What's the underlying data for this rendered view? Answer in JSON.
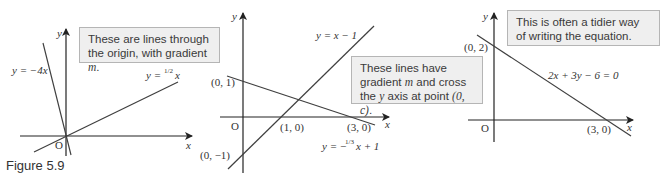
{
  "figure": {
    "caption": "Figure 5.9",
    "panels": [
      {
        "id": "panel-1",
        "note": "These are lines through the origin, with gradient m.",
        "note_parts": [
          "These are lines through the origin, with gradient ",
          "m",
          "."
        ],
        "axis_labels": {
          "x": "x",
          "y": "y",
          "origin": "O"
        },
        "lines": [
          {
            "label": "y = −4x"
          },
          {
            "label_prefix": "y = ",
            "label_frac": "1/2",
            "label_suffix": "x"
          }
        ]
      },
      {
        "id": "panel-2",
        "note_parts": [
          "These lines have gradient ",
          "m",
          " and cross the ",
          "y",
          " axis at point ",
          "(0, c)",
          "."
        ],
        "axis_labels": {
          "x": "x",
          "y": "y",
          "origin": "O"
        },
        "points": [
          "(0, 1)",
          "(0, −1)",
          "(1, 0)",
          "(3, 0)"
        ],
        "lines": [
          {
            "label": "y = x − 1"
          },
          {
            "label_prefix": "y = −",
            "label_frac": "1/3",
            "label_suffix": "x + 1"
          }
        ]
      },
      {
        "id": "panel-3",
        "note": "This is often a tidier way of writing the equation.",
        "axis_labels": {
          "x": "x",
          "y": "y",
          "origin": "O"
        },
        "points": [
          "(0, 2)",
          "(3, 0)"
        ],
        "lines": [
          {
            "label": "2x + 3y − 6 = 0"
          }
        ]
      }
    ]
  },
  "colors": {
    "line": "#3f3f3f",
    "note_bg": "#efefef",
    "note_border": "#b5b5b5",
    "text": "#333333"
  }
}
